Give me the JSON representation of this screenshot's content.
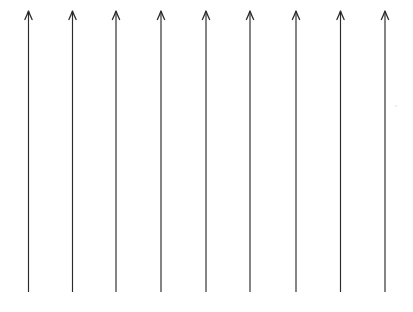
{
  "canvas": {
    "width": 413,
    "height": 312,
    "background_color": "#ffffff",
    "title": "Upward vertical arrow field"
  },
  "style": {
    "stroke_color": "#2b2b2b",
    "shaft_width": 1.15,
    "head_width": 1.3,
    "head_half_span": 3.6,
    "head_height": 8.5
  },
  "chart_data": {
    "type": "diagram",
    "subtype": "vector-field",
    "title": "",
    "xlabel": "",
    "ylabel": "",
    "grid": false,
    "legend": null,
    "annotations": [],
    "arrow_count": 9,
    "direction": "up",
    "tip_y": 11,
    "tail_y": 292,
    "x_positions": [
      28.5,
      72.5,
      116,
      161,
      206,
      250,
      296,
      340.5,
      385
    ],
    "arrows": [
      {
        "id": "arrow-1",
        "x": 28.5,
        "y_tip": 11,
        "y_tail": 292,
        "direction": "up"
      },
      {
        "id": "arrow-2",
        "x": 72.5,
        "y_tip": 11,
        "y_tail": 292,
        "direction": "up"
      },
      {
        "id": "arrow-3",
        "x": 116,
        "y_tip": 11,
        "y_tail": 292,
        "direction": "up"
      },
      {
        "id": "arrow-4",
        "x": 161,
        "y_tip": 11,
        "y_tail": 292,
        "direction": "up"
      },
      {
        "id": "arrow-5",
        "x": 206,
        "y_tip": 11,
        "y_tail": 292,
        "direction": "up"
      },
      {
        "id": "arrow-6",
        "x": 250,
        "y_tip": 11,
        "y_tail": 292,
        "direction": "up"
      },
      {
        "id": "arrow-7",
        "x": 296,
        "y_tip": 11,
        "y_tail": 292,
        "direction": "up"
      },
      {
        "id": "arrow-8",
        "x": 340.5,
        "y_tip": 11,
        "y_tail": 292,
        "direction": "up"
      },
      {
        "id": "arrow-9",
        "x": 385,
        "y_tip": 11,
        "y_tail": 292,
        "direction": "up"
      }
    ],
    "specks": [
      {
        "x": 395,
        "y": 105
      }
    ]
  }
}
